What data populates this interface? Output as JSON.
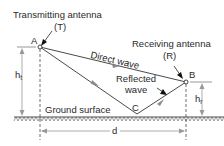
{
  "labels": {
    "transmitting_antenna": "Transmitting antenna",
    "transmitting_abbrev": "(T)",
    "receiving_antenna": "Receiving antenna",
    "receiving_abbrev": "(R)",
    "point_a": "A",
    "point_b": "B",
    "point_c": "C",
    "direct_wave": "Direct wave",
    "reflected_line1": "Reflected",
    "reflected_line2": "wave",
    "ground_surface": "Ground surface",
    "distance": "d",
    "ht_base": "h",
    "ht_sub": "t",
    "hr_base": "h",
    "hr_sub": "r"
  },
  "colors": {
    "line": "#4a4a4a",
    "arrow_gray": "#8a8a8a",
    "arrow_black": "#111111",
    "text": "#2a2a2a",
    "background": "#ffffff"
  }
}
